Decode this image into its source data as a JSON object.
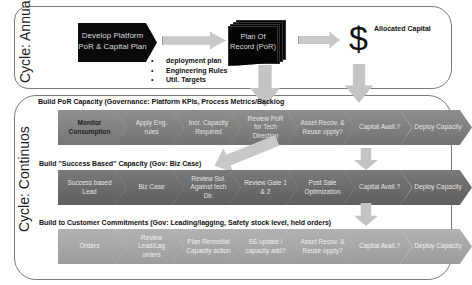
{
  "annual": {
    "cycle_label": "Cycle: Annual",
    "develop_box": "Develop Platform PoR & Capital Plan",
    "bullets": [
      "deployment plan",
      "Engineering Rules",
      "Util. Targets"
    ],
    "por_box": "Plan Of Record (PoR)",
    "dollar_symbol": "$",
    "allocated_capital": "Allocated Capital"
  },
  "continuous": {
    "cycle_label": "Cycle: Continuos",
    "sections": [
      {
        "title": "Build PoR  Capacity  (Governance: Platform KPIs, Process Metrics/Backlog",
        "steps": [
          "Monitor Consumption",
          "Apply Eng. rules",
          "Incr. Capacity Required",
          "Review PoR for Tech Direction",
          "Asset Recov. & Reuse oppty?",
          "Capital Avail.?",
          "Deploy Capacity"
        ]
      },
      {
        "title": "Build \"Success Based\" Capacity  (Gov:   Biz Case)",
        "steps": [
          "Success based Lead",
          "Biz Case",
          "Review Sol. Against tech Dir.",
          "Review Gate 1 & 2",
          "Post Sale Optimization",
          "Capital Avail.?",
          "Deploy Capacity"
        ]
      },
      {
        "title": "Build to Customer Commitments (Gov: Leading/lagging, Safety stock level, held orders)",
        "steps": [
          "Orders",
          "Review Lead/Lag orders",
          "Plan Remedial Capacity action",
          "SS update / capacity add?",
          "Asset Recov. & Reuse oppty?",
          "Capital Avail.?",
          "Deploy Capacity"
        ]
      }
    ]
  },
  "colors": {
    "row1": "#808080",
    "row2": "#6a6a6a",
    "row3": "#a8a8a8",
    "arrow": "#c8c8c8",
    "black_box": "#0a0a0a"
  }
}
